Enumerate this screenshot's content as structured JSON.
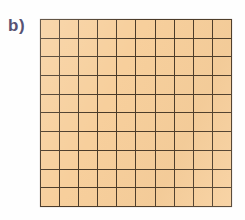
{
  "figure": {
    "label": "b)",
    "background_color": "#fefefe",
    "label_color": "#575273"
  },
  "chart_data": {
    "type": "heatmap",
    "title": "b)",
    "subtitle": "",
    "xlabel": "",
    "ylabel": "",
    "rows": 10,
    "columns": 10,
    "total_cells": 100,
    "shaded_cells": 100,
    "fraction_shaded": "100/100",
    "grid": true,
    "legend_position": "none",
    "cell_fill_color": "#f7cf9c",
    "grid_line_color": "#4a3a28",
    "x": [
      1,
      2,
      3,
      4,
      5,
      6,
      7,
      8,
      9,
      10
    ],
    "y": [
      1,
      2,
      3,
      4,
      5,
      6,
      7,
      8,
      9,
      10
    ],
    "xtick_labels": [
      "",
      "",
      "",
      "",
      "",
      "",
      "",
      "",
      "",
      ""
    ],
    "ytick_labels": [
      "",
      "",
      "",
      "",
      "",
      "",
      "",
      "",
      "",
      ""
    ],
    "values": [
      [
        1,
        1,
        1,
        1,
        1,
        1,
        1,
        1,
        1,
        1
      ],
      [
        1,
        1,
        1,
        1,
        1,
        1,
        1,
        1,
        1,
        1
      ],
      [
        1,
        1,
        1,
        1,
        1,
        1,
        1,
        1,
        1,
        1
      ],
      [
        1,
        1,
        1,
        1,
        1,
        1,
        1,
        1,
        1,
        1
      ],
      [
        1,
        1,
        1,
        1,
        1,
        1,
        1,
        1,
        1,
        1
      ],
      [
        1,
        1,
        1,
        1,
        1,
        1,
        1,
        1,
        1,
        1
      ],
      [
        1,
        1,
        1,
        1,
        1,
        1,
        1,
        1,
        1,
        1
      ],
      [
        1,
        1,
        1,
        1,
        1,
        1,
        1,
        1,
        1,
        1
      ],
      [
        1,
        1,
        1,
        1,
        1,
        1,
        1,
        1,
        1,
        1
      ],
      [
        1,
        1,
        1,
        1,
        1,
        1,
        1,
        1,
        1,
        1
      ]
    ],
    "annotations": []
  }
}
